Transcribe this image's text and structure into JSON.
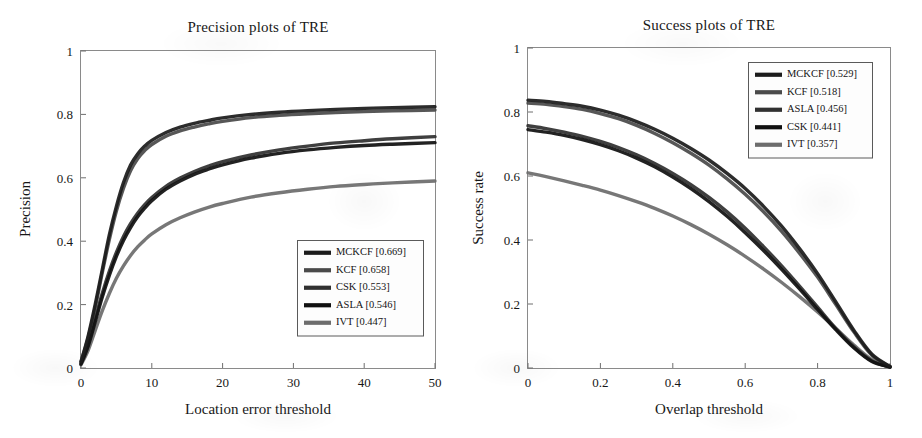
{
  "figure": {
    "background": "#ffffff",
    "panel_count": 2
  },
  "chart_data": [
    {
      "type": "line",
      "title": "Precision plots of TRE",
      "xlabel": "Location error threshold",
      "ylabel": "Precision",
      "xlim": [
        0,
        50
      ],
      "ylim": [
        0,
        1
      ],
      "xticks": [
        "0",
        "10",
        "20",
        "30",
        "40",
        "50"
      ],
      "yticks": [
        "0",
        "0.2",
        "0.4",
        "0.6",
        "0.8",
        "1"
      ],
      "grid": false,
      "legend_position": "lower-right",
      "x": [
        0,
        1,
        2,
        3,
        4,
        5,
        6,
        7,
        8,
        9,
        10,
        12,
        14,
        16,
        18,
        20,
        24,
        28,
        32,
        36,
        40,
        44,
        50
      ],
      "series": [
        {
          "name": "MCKCF",
          "score": "0.669",
          "label": "MCKCF [0.669]",
          "color": "#1c1c1c",
          "values": [
            0.02,
            0.1,
            0.2,
            0.31,
            0.42,
            0.51,
            0.585,
            0.64,
            0.675,
            0.7,
            0.718,
            0.743,
            0.76,
            0.772,
            0.781,
            0.789,
            0.8,
            0.807,
            0.812,
            0.816,
            0.819,
            0.821,
            0.824
          ]
        },
        {
          "name": "KCF",
          "score": "0.658",
          "label": "KCF [0.658]",
          "color": "#4a4a4a",
          "values": [
            0.02,
            0.095,
            0.19,
            0.3,
            0.405,
            0.495,
            0.567,
            0.622,
            0.66,
            0.686,
            0.705,
            0.731,
            0.748,
            0.76,
            0.77,
            0.778,
            0.79,
            0.797,
            0.802,
            0.806,
            0.809,
            0.811,
            0.814
          ]
        },
        {
          "name": "CSK",
          "score": "0.553",
          "label": "CSK [0.553]",
          "color": "#303030",
          "values": [
            0.015,
            0.075,
            0.155,
            0.235,
            0.305,
            0.365,
            0.415,
            0.455,
            0.488,
            0.515,
            0.538,
            0.573,
            0.599,
            0.62,
            0.637,
            0.651,
            0.672,
            0.688,
            0.7,
            0.71,
            0.717,
            0.723,
            0.73
          ]
        },
        {
          "name": "ASLA",
          "score": "0.546",
          "label": "ASLA [0.546]",
          "color": "#111111",
          "values": [
            0.012,
            0.068,
            0.145,
            0.223,
            0.292,
            0.352,
            0.402,
            0.443,
            0.477,
            0.504,
            0.528,
            0.564,
            0.59,
            0.611,
            0.627,
            0.641,
            0.662,
            0.677,
            0.688,
            0.696,
            0.702,
            0.706,
            0.711
          ]
        },
        {
          "name": "IVT",
          "score": "0.447",
          "label": "IVT [0.447]",
          "color": "#6d6d6d",
          "values": [
            0.01,
            0.055,
            0.118,
            0.18,
            0.235,
            0.283,
            0.322,
            0.355,
            0.382,
            0.404,
            0.423,
            0.452,
            0.474,
            0.492,
            0.507,
            0.519,
            0.539,
            0.553,
            0.564,
            0.573,
            0.579,
            0.584,
            0.59
          ]
        }
      ]
    },
    {
      "type": "line",
      "title": "Success plots of TRE",
      "xlabel": "Overlap threshold",
      "ylabel": "Success rate",
      "xlim": [
        0,
        1
      ],
      "ylim": [
        0,
        1
      ],
      "xticks": [
        "0",
        "0.2",
        "0.4",
        "0.6",
        "0.8",
        "1"
      ],
      "yticks": [
        "0",
        "0.2",
        "0.4",
        "0.6",
        "0.8",
        "1"
      ],
      "grid": false,
      "legend_position": "upper-right",
      "x": [
        0,
        0.05,
        0.1,
        0.15,
        0.2,
        0.25,
        0.3,
        0.35,
        0.4,
        0.45,
        0.5,
        0.55,
        0.6,
        0.65,
        0.7,
        0.75,
        0.8,
        0.85,
        0.9,
        0.95,
        1
      ],
      "series": [
        {
          "name": "MCKCF",
          "score": "0.529",
          "label": "MCKCF [0.529]",
          "color": "#1c1c1c",
          "values": [
            0.837,
            0.833,
            0.826,
            0.818,
            0.806,
            0.79,
            0.77,
            0.746,
            0.718,
            0.686,
            0.65,
            0.608,
            0.561,
            0.506,
            0.444,
            0.373,
            0.295,
            0.207,
            0.118,
            0.043,
            0.005
          ]
        },
        {
          "name": "KCF",
          "score": "0.518",
          "label": "KCF [0.518]",
          "color": "#4a4a4a",
          "values": [
            0.828,
            0.824,
            0.817,
            0.808,
            0.795,
            0.779,
            0.758,
            0.733,
            0.704,
            0.671,
            0.634,
            0.591,
            0.543,
            0.489,
            0.428,
            0.359,
            0.284,
            0.199,
            0.113,
            0.04,
            0.004
          ]
        },
        {
          "name": "ASLA",
          "score": "0.456",
          "label": "ASLA [0.456]",
          "color": "#303030",
          "values": [
            0.757,
            0.748,
            0.737,
            0.724,
            0.708,
            0.689,
            0.666,
            0.639,
            0.608,
            0.573,
            0.533,
            0.488,
            0.437,
            0.38,
            0.32,
            0.256,
            0.19,
            0.124,
            0.066,
            0.022,
            0.003
          ]
        },
        {
          "name": "CSK",
          "score": "0.441",
          "label": "CSK [0.441]",
          "color": "#111111",
          "values": [
            0.745,
            0.737,
            0.727,
            0.714,
            0.698,
            0.679,
            0.656,
            0.629,
            0.597,
            0.561,
            0.52,
            0.474,
            0.423,
            0.368,
            0.309,
            0.247,
            0.183,
            0.12,
            0.063,
            0.02,
            0.003
          ]
        },
        {
          "name": "IVT",
          "score": "0.357",
          "label": "IVT [0.357]",
          "color": "#6d6d6d",
          "values": [
            0.61,
            0.598,
            0.585,
            0.571,
            0.556,
            0.539,
            0.52,
            0.499,
            0.475,
            0.448,
            0.418,
            0.385,
            0.349,
            0.31,
            0.268,
            0.223,
            0.175,
            0.124,
            0.072,
            0.026,
            0.002
          ]
        }
      ]
    }
  ]
}
